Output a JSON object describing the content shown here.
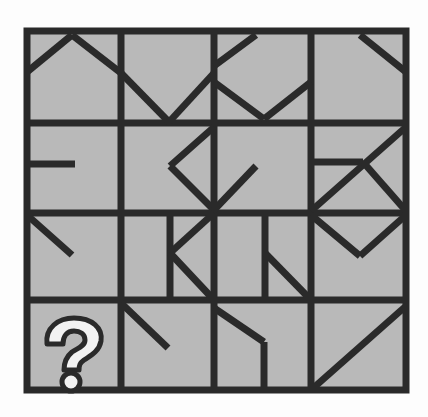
{
  "puzzle": {
    "type": "visual-pattern-grid",
    "rows": 4,
    "cols": 4,
    "missing_cell": {
      "row": 4,
      "col": 1,
      "symbol": "?"
    },
    "colors": {
      "background": "#fdfdfd",
      "cell_fill": "#b9b9b9",
      "line": "#2a2a2a",
      "question_fill": "#f2f2f2"
    },
    "frame": {
      "x1": 27,
      "y1": 31,
      "x2": 406,
      "y2": 390
    },
    "grid_lines": {
      "vertical": [
        121,
        214,
        311
      ],
      "horizontal": [
        123,
        213,
        300
      ]
    },
    "segments": [
      {
        "x1": 27,
        "y1": 72,
        "x2": 72,
        "y2": 35
      },
      {
        "x1": 72,
        "y1": 35,
        "x2": 121,
        "y2": 73
      },
      {
        "x1": 121,
        "y1": 73,
        "x2": 169,
        "y2": 122
      },
      {
        "x1": 169,
        "y1": 122,
        "x2": 214,
        "y2": 73
      },
      {
        "x1": 214,
        "y1": 66,
        "x2": 256,
        "y2": 35
      },
      {
        "x1": 214,
        "y1": 82,
        "x2": 264,
        "y2": 119
      },
      {
        "x1": 264,
        "y1": 119,
        "x2": 311,
        "y2": 82
      },
      {
        "x1": 360,
        "y1": 35,
        "x2": 406,
        "y2": 72
      },
      {
        "x1": 27,
        "y1": 164,
        "x2": 75,
        "y2": 164
      },
      {
        "x1": 214,
        "y1": 127,
        "x2": 170,
        "y2": 166
      },
      {
        "x1": 170,
        "y1": 166,
        "x2": 214,
        "y2": 210
      },
      {
        "x1": 214,
        "y1": 210,
        "x2": 256,
        "y2": 166
      },
      {
        "x1": 311,
        "y1": 162,
        "x2": 363,
        "y2": 162
      },
      {
        "x1": 311,
        "y1": 211,
        "x2": 406,
        "y2": 127
      },
      {
        "x1": 363,
        "y1": 162,
        "x2": 406,
        "y2": 211
      },
      {
        "x1": 27,
        "y1": 215,
        "x2": 72,
        "y2": 255
      },
      {
        "x1": 170,
        "y1": 213,
        "x2": 170,
        "y2": 300
      },
      {
        "x1": 170,
        "y1": 253,
        "x2": 214,
        "y2": 213
      },
      {
        "x1": 170,
        "y1": 253,
        "x2": 214,
        "y2": 300
      },
      {
        "x1": 265,
        "y1": 213,
        "x2": 265,
        "y2": 300
      },
      {
        "x1": 265,
        "y1": 253,
        "x2": 311,
        "y2": 300
      },
      {
        "x1": 311,
        "y1": 215,
        "x2": 360,
        "y2": 256
      },
      {
        "x1": 360,
        "y1": 256,
        "x2": 406,
        "y2": 215
      },
      {
        "x1": 121,
        "y1": 303,
        "x2": 168,
        "y2": 348
      },
      {
        "x1": 214,
        "y1": 308,
        "x2": 264,
        "y2": 342
      },
      {
        "x1": 264,
        "y1": 342,
        "x2": 264,
        "y2": 390
      },
      {
        "x1": 311,
        "y1": 390,
        "x2": 406,
        "y2": 306
      }
    ]
  }
}
